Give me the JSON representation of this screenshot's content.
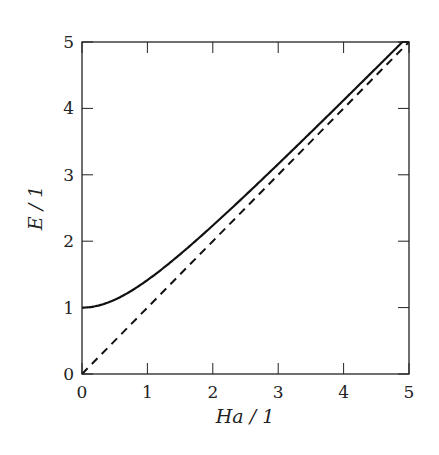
{
  "chart_data": {
    "type": "line",
    "title": "",
    "xlabel": "Ha / 1",
    "ylabel": "E / 1",
    "xlim": [
      0,
      5
    ],
    "ylim": [
      0,
      5
    ],
    "xticks": [
      "0",
      "1",
      "2",
      "3",
      "4",
      "5"
    ],
    "yticks": [
      "0",
      "1",
      "2",
      "3",
      "4",
      "5"
    ],
    "grid": false,
    "legend": null,
    "series": [
      {
        "name": "E = sqrt(1 + Ha^2)",
        "style": "solid",
        "x": [
          0,
          0.25,
          0.5,
          0.75,
          1,
          1.5,
          2,
          2.5,
          3,
          3.5,
          4,
          4.5,
          5
        ],
        "y": [
          1.0,
          1.03,
          1.12,
          1.25,
          1.41,
          1.8,
          2.24,
          2.69,
          3.16,
          3.64,
          4.12,
          4.61,
          5.1
        ]
      },
      {
        "name": "E = Ha",
        "style": "dashed",
        "x": [
          0,
          1,
          2,
          3,
          4,
          5
        ],
        "y": [
          0,
          1,
          2,
          3,
          4,
          5
        ]
      }
    ]
  }
}
